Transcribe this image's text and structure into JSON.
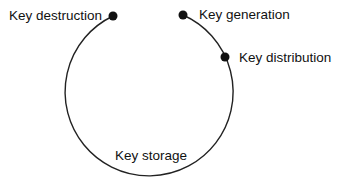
{
  "diagram": {
    "type": "cycle",
    "stroke_color": "#222222",
    "node_color": "#111111",
    "nodes": [
      {
        "id": "generation",
        "label": "Key generation"
      },
      {
        "id": "distribution",
        "label": "Key distribution"
      },
      {
        "id": "storage",
        "label": "Key storage"
      },
      {
        "id": "destruction",
        "label": "Key destruction"
      }
    ]
  }
}
